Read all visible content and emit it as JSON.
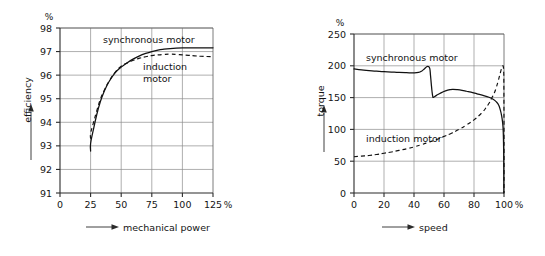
{
  "figure": {
    "background_color": "#ffffff",
    "ink_color": "#111111",
    "grid_color": "#8c8c8c"
  },
  "chart_data": [
    {
      "type": "line",
      "title": "",
      "xlabel": "mechanical power",
      "ylabel": "efficiency",
      "x_unit": "%",
      "y_unit": "%",
      "xlim": [
        0,
        125
      ],
      "ylim": [
        91,
        98
      ],
      "xticks": [
        0,
        25,
        50,
        75,
        100,
        125
      ],
      "xtick_labels": [
        "0",
        "25",
        "50",
        "75",
        "100",
        "125"
      ],
      "yticks": [
        91,
        92,
        93,
        94,
        95,
        96,
        97,
        98
      ],
      "ytick_labels": [
        "91",
        "92",
        "93",
        "94",
        "95",
        "96",
        "97",
        "98"
      ],
      "grid": true,
      "legend_position": "inline-annotations",
      "series": [
        {
          "name": "synchronous motor",
          "style": "solid",
          "label_x": 55,
          "label_y": 97.62,
          "x": [
            25,
            25,
            27,
            30,
            33,
            36,
            40,
            45,
            50,
            55,
            60,
            65,
            70,
            75,
            80,
            85,
            90,
            95,
            100,
            105,
            110,
            115,
            120,
            125
          ],
          "y": [
            92.78,
            93.1,
            93.62,
            94.32,
            94.88,
            95.3,
            95.72,
            96.1,
            96.34,
            96.53,
            96.69,
            96.82,
            96.92,
            97.0,
            97.06,
            97.1,
            97.13,
            97.15,
            97.16,
            97.16,
            97.16,
            97.16,
            97.16,
            97.16
          ]
        },
        {
          "name": "induction motor",
          "style": "dashed",
          "label_x": 74,
          "label_y": 96.78,
          "label_line2": "motor",
          "x": [
            25,
            25,
            27,
            30,
            33,
            36,
            40,
            45,
            50,
            55,
            60,
            65,
            70,
            75,
            80,
            85,
            90,
            95,
            100,
            105,
            110,
            115,
            120,
            125
          ],
          "y": [
            93.3,
            93.52,
            93.92,
            94.48,
            94.98,
            95.34,
            95.74,
            96.12,
            96.38,
            96.52,
            96.63,
            96.72,
            96.78,
            96.83,
            96.86,
            96.88,
            96.89,
            96.88,
            96.86,
            96.84,
            96.82,
            96.8,
            96.79,
            96.78
          ]
        }
      ]
    },
    {
      "type": "line",
      "title": "",
      "xlabel": "speed",
      "ylabel": "torque",
      "x_unit": "%",
      "y_unit": "%",
      "xlim": [
        0,
        100
      ],
      "ylim": [
        0,
        250
      ],
      "xticks": [
        0,
        20,
        40,
        60,
        80,
        100
      ],
      "xtick_labels": [
        "0",
        "20",
        "40",
        "60",
        "80",
        "100"
      ],
      "yticks": [
        0,
        50,
        100,
        150,
        200,
        250
      ],
      "ytick_labels": [
        "0",
        "50",
        "100",
        "150",
        "200",
        "250"
      ],
      "grid": true,
      "legend_position": "inline-annotations",
      "series": [
        {
          "name": "synchronous motor",
          "style": "solid",
          "label_x": 8,
          "label_y": 216,
          "x": [
            0,
            5,
            10,
            15,
            20,
            25,
            30,
            35,
            40,
            43,
            45,
            47,
            48.5,
            49.5,
            50.5,
            51,
            51.5,
            52,
            52.5,
            53,
            55,
            58,
            61,
            64,
            66,
            69,
            72,
            75,
            78,
            82,
            86,
            90,
            93,
            95,
            96.5,
            97.5,
            98.3,
            99,
            99.5,
            99.8,
            99.9
          ],
          "y": [
            195,
            193.5,
            192.5,
            191.5,
            190.8,
            190.2,
            189.6,
            189.2,
            188.9,
            189.5,
            191.5,
            195.5,
            198.5,
            199,
            196,
            185,
            172,
            160,
            152,
            150.5,
            153.5,
            157.5,
            160.5,
            162.5,
            163,
            162.5,
            161.5,
            160,
            158.5,
            156,
            153.5,
            150.5,
            147,
            143,
            138,
            131,
            123,
            112,
            96,
            60,
            0
          ]
        },
        {
          "name": "induction motor",
          "style": "dashed",
          "label_x": 8,
          "label_y": 88,
          "x": [
            0,
            5,
            10,
            15,
            20,
            25,
            30,
            35,
            40,
            45,
            50,
            55,
            60,
            65,
            70,
            75,
            80,
            83,
            86,
            88,
            90,
            92,
            93.5,
            95,
            96,
            97,
            97.8,
            98.4,
            98.9,
            99.3,
            99.6,
            99.8,
            99.9,
            100,
            100
          ],
          "y": [
            57,
            58,
            59,
            60.5,
            62.5,
            64.5,
            67,
            69.5,
            72.5,
            76,
            80,
            84,
            89,
            94,
            100,
            107,
            115,
            121,
            128,
            134,
            141,
            150,
            157,
            167,
            175,
            184,
            191,
            196,
            199,
            200,
            198,
            190,
            175,
            100,
            0
          ]
        }
      ]
    }
  ],
  "panels": {
    "efficiency": {
      "y_unit": "%",
      "x_unit": "%",
      "y_axis_title": "efficiency",
      "x_axis_title": "mechanical power",
      "ytick_labels": [
        "98",
        "97",
        "96",
        "95",
        "94",
        "93",
        "92",
        "91"
      ],
      "xtick_labels": [
        "0",
        "25",
        "50",
        "75",
        "100",
        "125"
      ],
      "annotation_synchronous": "synchronous motor",
      "annotation_induction_line1": "induction",
      "annotation_induction_line2": "motor"
    },
    "torque": {
      "y_unit": "%",
      "x_unit": "%",
      "y_axis_title": "torque",
      "x_axis_title": "speed",
      "ytick_labels": [
        "250",
        "200",
        "150",
        "100",
        "50",
        "0"
      ],
      "xtick_labels": [
        "0",
        "20",
        "40",
        "60",
        "80",
        "100"
      ],
      "annotation_synchronous": "synchronous motor",
      "annotation_induction": "induction motor"
    }
  }
}
